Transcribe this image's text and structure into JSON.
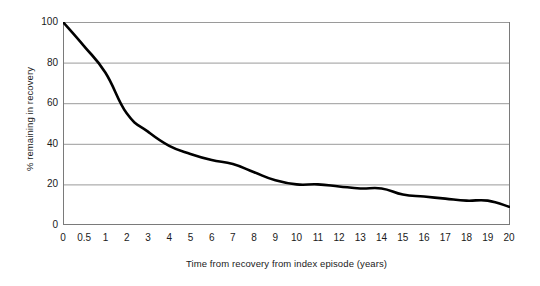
{
  "chart_data": {
    "type": "line",
    "title": "",
    "xlabel": "Time from recovery from index episode (years)",
    "ylabel": "% remaining in recovery",
    "categories": [
      "0",
      "0.5",
      "1",
      "2",
      "3",
      "4",
      "5",
      "6",
      "7",
      "8",
      "9",
      "10",
      "11",
      "12",
      "13",
      "14",
      "15",
      "16",
      "17",
      "18",
      "19",
      "20"
    ],
    "x": [
      0,
      0.5,
      1,
      2,
      3,
      4,
      5,
      6,
      7,
      8,
      9,
      10,
      11,
      12,
      13,
      14,
      15,
      16,
      17,
      18,
      19,
      20
    ],
    "values": [
      100,
      88,
      75,
      55,
      46,
      39,
      35,
      32,
      30,
      26,
      22,
      20,
      20,
      19,
      18,
      18,
      15,
      14,
      13,
      12,
      12,
      9
    ],
    "series": [
      {
        "name": "% remaining in recovery",
        "values": [
          100,
          88,
          75,
          55,
          46,
          39,
          35,
          32,
          30,
          26,
          22,
          20,
          20,
          19,
          18,
          18,
          15,
          14,
          13,
          12,
          12,
          9
        ],
        "color": "#000000"
      }
    ],
    "ylim": [
      0,
      100
    ],
    "ytick_labels": [
      "100",
      "80",
      "60",
      "40",
      "20",
      "0"
    ],
    "ytick_values": [
      100,
      80,
      60,
      40,
      20,
      0
    ],
    "xtick_labels": [
      "0",
      "0.5",
      "1",
      "2",
      "3",
      "4",
      "5",
      "6",
      "7",
      "8",
      "9",
      "10",
      "11",
      "12",
      "13",
      "14",
      "15",
      "16",
      "17",
      "18",
      "19",
      "20"
    ],
    "grid": "horizontal",
    "legend": "none",
    "axis_scale": "categorical",
    "colors": {
      "line": "#000000",
      "gridline": "#9a9a9a",
      "axis": "#7a7a7a",
      "background": "#ffffff",
      "text": "#1a1a1a"
    }
  }
}
